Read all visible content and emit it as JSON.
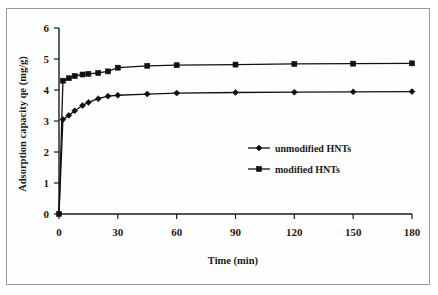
{
  "figure": {
    "background": "#ffffff",
    "border_color": "#9a9a9a",
    "line_color": "#111111"
  },
  "chart_data": {
    "type": "line",
    "title": "",
    "xlabel": "Time (min)",
    "ylabel": "Adsorption capacity qe (mg/g)",
    "xlim": [
      0,
      180
    ],
    "ylim": [
      0,
      6
    ],
    "xticks": [
      0,
      30,
      60,
      90,
      120,
      150,
      180
    ],
    "yticks": [
      0,
      1,
      2,
      3,
      4,
      5,
      6
    ],
    "xtick_labels": [
      "0",
      "30",
      "60",
      "90",
      "120",
      "150",
      "180"
    ],
    "ytick_labels": [
      "0",
      "1",
      "2",
      "3",
      "4",
      "5",
      "6"
    ],
    "grid": false,
    "legend_position": "center-right",
    "series": [
      {
        "name": "unmodified HNTs",
        "marker": "diamond",
        "x": [
          0,
          2,
          5,
          8,
          12,
          15,
          20,
          25,
          30,
          45,
          60,
          90,
          120,
          150,
          180
        ],
        "y": [
          0,
          3.05,
          3.18,
          3.33,
          3.5,
          3.6,
          3.72,
          3.8,
          3.83,
          3.87,
          3.9,
          3.92,
          3.93,
          3.94,
          3.95
        ]
      },
      {
        "name": "modified HNTs",
        "marker": "square",
        "x": [
          0,
          2,
          5,
          8,
          12,
          15,
          20,
          25,
          30,
          45,
          60,
          90,
          120,
          150,
          180
        ],
        "y": [
          0,
          4.3,
          4.38,
          4.45,
          4.5,
          4.52,
          4.55,
          4.6,
          4.72,
          4.78,
          4.8,
          4.82,
          4.84,
          4.85,
          4.86
        ]
      }
    ]
  },
  "legend": {
    "items": [
      {
        "label": "unmodified HNTs",
        "marker": "diamond"
      },
      {
        "label": "modified HNTs",
        "marker": "square"
      }
    ]
  }
}
